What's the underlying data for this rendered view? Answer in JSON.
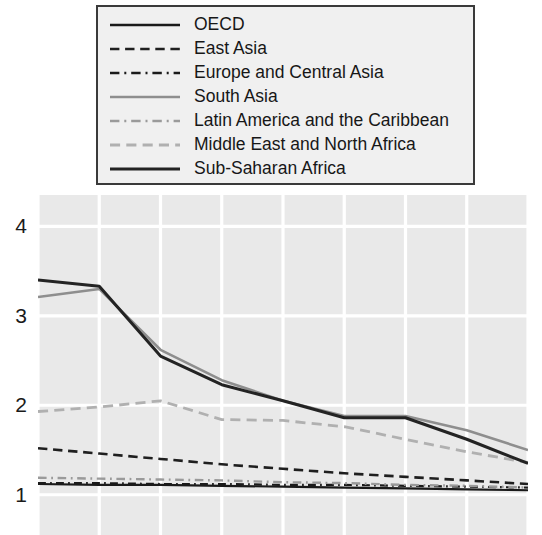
{
  "chart_data": {
    "type": "line",
    "title": "",
    "subtitle": "",
    "xlabel": "",
    "ylabel": "",
    "grid": true,
    "legend_position": "top",
    "xlim": [
      0,
      8
    ],
    "ylim": [
      0.55,
      4.35
    ],
    "y_ticks": [
      1,
      2,
      3,
      4
    ],
    "y_tick_labels": [
      "1",
      "2",
      "3",
      "4"
    ],
    "x_ticks": [
      0,
      1,
      2,
      3,
      4,
      5,
      6,
      7,
      8
    ],
    "x_tick_labels": [
      "",
      "",
      "",
      "",
      "",
      "",
      "",
      "",
      ""
    ],
    "x": [
      0,
      1,
      2,
      3,
      4,
      5,
      6,
      7,
      8
    ],
    "series": [
      {
        "name": "OECD",
        "color": "#1a1a1a",
        "style": "solid",
        "width": 2.2,
        "values": [
          1.12,
          1.11,
          1.11,
          1.1,
          1.09,
          1.08,
          1.07,
          1.06,
          1.05
        ]
      },
      {
        "name": "East Asia",
        "color": "#1f1f1f",
        "style": "dashed",
        "width": 2.6,
        "values": [
          1.52,
          1.46,
          1.4,
          1.34,
          1.29,
          1.24,
          1.2,
          1.16,
          1.12
        ]
      },
      {
        "name": "Europe and Central Asia",
        "color": "#1a1a1a",
        "style": "dashdot",
        "width": 2.2,
        "values": [
          1.13,
          1.13,
          1.12,
          1.12,
          1.11,
          1.11,
          1.1,
          1.09,
          1.08
        ]
      },
      {
        "name": "South Asia",
        "color": "#8e8e8e",
        "style": "solid",
        "width": 2.6,
        "values": [
          3.21,
          3.3,
          2.62,
          2.28,
          2.05,
          1.88,
          1.88,
          1.72,
          1.5
        ]
      },
      {
        "name": "Latin America and the Caribbean",
        "color": "#9a9a9a",
        "style": "dashdot",
        "width": 2.4,
        "values": [
          1.19,
          1.18,
          1.17,
          1.16,
          1.14,
          1.13,
          1.11,
          1.1,
          1.08
        ]
      },
      {
        "name": "Middle East and North Africa",
        "color": "#b0b0b0",
        "style": "dashed",
        "width": 2.8,
        "values": [
          1.93,
          1.98,
          2.05,
          1.84,
          1.83,
          1.76,
          1.62,
          1.48,
          1.36
        ]
      },
      {
        "name": "Sub-Saharan Africa",
        "color": "#232323",
        "style": "solid",
        "width": 3.0,
        "values": [
          3.4,
          3.33,
          2.55,
          2.23,
          2.05,
          1.86,
          1.86,
          1.62,
          1.35
        ]
      }
    ]
  },
  "axes": {
    "y_labels": [
      "4",
      "3",
      "2",
      "1"
    ]
  },
  "legend": {
    "entries": [
      {
        "label": "OECD"
      },
      {
        "label": "East Asia"
      },
      {
        "label": "Europe and Central Asia"
      },
      {
        "label": "South Asia"
      },
      {
        "label": "Latin America and the Caribbean"
      },
      {
        "label": "Middle East and North Africa"
      },
      {
        "label": "Sub-Saharan Africa"
      }
    ]
  }
}
